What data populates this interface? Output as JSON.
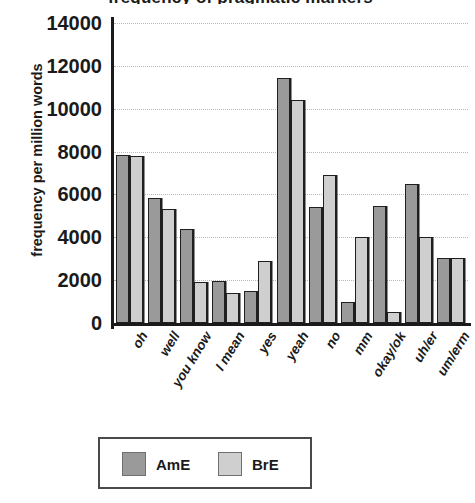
{
  "chart_data": {
    "type": "bar",
    "title": "frequency of pragmatic markers",
    "xlabel": "",
    "ylabel": "frequency per million words",
    "ylim": [
      0,
      14000
    ],
    "yticks": [
      0,
      2000,
      4000,
      6000,
      8000,
      10000,
      12000,
      14000
    ],
    "grid": true,
    "legend_position": "bottom",
    "categories": [
      "oh",
      "well",
      "you know",
      "I mean",
      "yes",
      "yeah",
      "no",
      "mm",
      "okay/ok",
      "uh/er",
      "um/erm"
    ],
    "series": [
      {
        "name": "AmE",
        "color": "#9a9a9a",
        "values": [
          7850,
          5850,
          4400,
          1950,
          1500,
          11450,
          5400,
          1000,
          5450,
          6500,
          3050
        ]
      },
      {
        "name": "BrE",
        "color": "#cfcfcf",
        "values": [
          7800,
          5300,
          1900,
          1400,
          2900,
          10400,
          6900,
          4000,
          500,
          4000,
          3050
        ]
      }
    ]
  },
  "axis": {
    "y_title": "frequency per million words",
    "y_tick_labels": [
      "14000",
      "12000",
      "10000",
      "8000",
      "6000",
      "4000",
      "2000",
      "0"
    ]
  },
  "legend": {
    "entries": [
      {
        "label": "AmE",
        "color": "#9a9a9a"
      },
      {
        "label": "BrE",
        "color": "#cfcfcf"
      }
    ]
  }
}
